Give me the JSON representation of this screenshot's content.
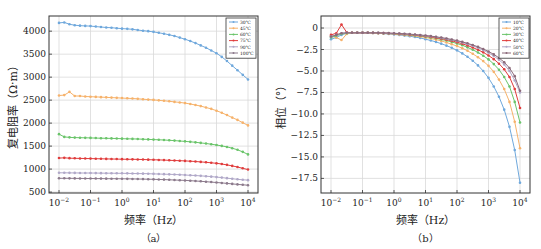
{
  "figure": {
    "panels": [
      {
        "id": "a",
        "caption": "（a）"
      },
      {
        "id": "b",
        "caption": "（b）"
      }
    ]
  },
  "chart_data": [
    {
      "type": "line",
      "panel": "(a)",
      "title": "",
      "xlabel": "频率（Hz）",
      "ylabel": "复电阻率（Ω·m）",
      "xscale": "log",
      "xlim": [
        0.01,
        10000
      ],
      "ylim": [
        480,
        4330
      ],
      "xticks": [
        "10⁻²",
        "10⁻¹",
        "10⁰",
        "10¹",
        "10²",
        "10³",
        "10⁴"
      ],
      "yticks": [
        500,
        1000,
        1500,
        2000,
        2500,
        3000,
        3500,
        4000
      ],
      "grid": true,
      "legend_position": "upper right",
      "x": [
        0.01,
        0.0147,
        0.0215,
        0.0316,
        0.0464,
        0.0681,
        0.1,
        0.147,
        0.215,
        0.316,
        0.464,
        0.681,
        1,
        1.47,
        2.15,
        3.16,
        4.64,
        6.81,
        10,
        14.7,
        21.5,
        31.6,
        46.4,
        68.1,
        100,
        147,
        215,
        316,
        464,
        681,
        1000,
        1470,
        2150,
        3160,
        4640,
        6810,
        10000
      ],
      "series": [
        {
          "name": "30℃",
          "color": "#6fa8dc",
          "values": [
            4180,
            4190,
            4150,
            4130,
            4120,
            4115,
            4110,
            4100,
            4090,
            4080,
            4075,
            4065,
            4055,
            4050,
            4040,
            4025,
            4010,
            4000,
            3985,
            3965,
            3945,
            3920,
            3895,
            3860,
            3825,
            3785,
            3740,
            3690,
            3640,
            3580,
            3520,
            3440,
            3350,
            3250,
            3150,
            3050,
            2950
          ]
        },
        {
          "name": "45℃",
          "color": "#f6b26b",
          "values": [
            2600,
            2610,
            2680,
            2590,
            2590,
            2580,
            2575,
            2570,
            2565,
            2560,
            2555,
            2550,
            2545,
            2540,
            2535,
            2528,
            2520,
            2512,
            2505,
            2495,
            2485,
            2475,
            2462,
            2450,
            2435,
            2415,
            2395,
            2370,
            2340,
            2310,
            2270,
            2225,
            2175,
            2120,
            2070,
            2010,
            1950
          ]
        },
        {
          "name": "60℃",
          "color": "#6ac46a",
          "values": [
            1760,
            1700,
            1690,
            1685,
            1682,
            1680,
            1678,
            1675,
            1672,
            1670,
            1668,
            1665,
            1662,
            1660,
            1657,
            1654,
            1650,
            1646,
            1642,
            1637,
            1632,
            1626,
            1620,
            1612,
            1603,
            1593,
            1582,
            1570,
            1557,
            1542,
            1525,
            1505,
            1482,
            1455,
            1420,
            1375,
            1320
          ]
        },
        {
          "name": "75℃",
          "color": "#e03c3c",
          "values": [
            1240,
            1245,
            1238,
            1235,
            1232,
            1230,
            1228,
            1226,
            1224,
            1222,
            1220,
            1218,
            1216,
            1214,
            1212,
            1210,
            1208,
            1205,
            1202,
            1199,
            1196,
            1192,
            1188,
            1183,
            1178,
            1172,
            1165,
            1157,
            1148,
            1137,
            1125,
            1110,
            1092,
            1070,
            1045,
            1018,
            990
          ]
        },
        {
          "name": "90℃",
          "color": "#b0a8c8",
          "values": [
            920,
            920,
            918,
            917,
            916,
            915,
            914,
            913,
            912,
            911,
            910,
            909,
            908,
            907,
            905,
            903,
            901,
            899,
            896,
            893,
            890,
            886,
            882,
            877,
            872,
            866,
            860,
            853,
            845,
            836,
            826,
            815,
            803,
            790,
            778,
            768,
            760
          ]
        },
        {
          "name": "100℃",
          "color": "#8c7a8c",
          "values": [
            800,
            800,
            799,
            798,
            797,
            796,
            795,
            794,
            793,
            792,
            791,
            790,
            789,
            788,
            786,
            784,
            782,
            780,
            777,
            774,
            771,
            767,
            763,
            758,
            753,
            747,
            741,
            734,
            726,
            718,
            709,
            699,
            689,
            678,
            667,
            658,
            650
          ]
        }
      ]
    },
    {
      "type": "line",
      "panel": "(b)",
      "title": "",
      "xlabel": "频率（Hz）",
      "ylabel": "相位（°）",
      "xscale": "log",
      "xlim": [
        0.01,
        10000
      ],
      "ylim": [
        -19.2,
        1.4
      ],
      "xticks": [
        "10⁻²",
        "10⁻¹",
        "10⁰",
        "10¹",
        "10²",
        "10³",
        "10⁴"
      ],
      "yticks": [
        0,
        -2.5,
        -5.0,
        -7.5,
        -10.0,
        -12.5,
        -15.0,
        -17.5
      ],
      "ytick_labels": [
        "0",
        "−2.5",
        "−5.0",
        "−7.5",
        "−10.0",
        "−12.5",
        "−15.0",
        "−17.5"
      ],
      "grid": true,
      "legend_position": "upper right",
      "x": [
        0.01,
        0.0147,
        0.0215,
        0.0316,
        0.0464,
        0.0681,
        0.1,
        0.147,
        0.215,
        0.316,
        0.464,
        0.681,
        1,
        1.47,
        2.15,
        3.16,
        4.64,
        6.81,
        10,
        14.7,
        21.5,
        31.6,
        46.4,
        68.1,
        100,
        147,
        215,
        316,
        464,
        681,
        1000,
        1470,
        2150,
        3160,
        4640,
        6810,
        10000
      ],
      "series": [
        {
          "name": "10℃",
          "color": "#6fa8dc",
          "values": [
            -1.3,
            -1.1,
            -0.8,
            -0.6,
            -0.55,
            -0.55,
            -0.55,
            -0.55,
            -0.58,
            -0.6,
            -0.65,
            -0.7,
            -0.75,
            -0.8,
            -0.88,
            -0.95,
            -1.05,
            -1.15,
            -1.3,
            -1.45,
            -1.62,
            -1.82,
            -2.05,
            -2.3,
            -2.6,
            -2.95,
            -3.35,
            -3.8,
            -4.35,
            -5.0,
            -5.8,
            -6.8,
            -8.0,
            -9.5,
            -11.5,
            -14.2,
            -18.0
          ]
        },
        {
          "name": "20℃",
          "color": "#f6b26b",
          "values": [
            -0.9,
            -1.1,
            -1.4,
            -0.7,
            -0.55,
            -0.55,
            -0.55,
            -0.55,
            -0.57,
            -0.6,
            -0.63,
            -0.67,
            -0.7,
            -0.75,
            -0.8,
            -0.86,
            -0.93,
            -1.0,
            -1.1,
            -1.22,
            -1.35,
            -1.5,
            -1.68,
            -1.88,
            -2.1,
            -2.35,
            -2.65,
            -3.0,
            -3.4,
            -3.85,
            -4.4,
            -5.1,
            -6.0,
            -7.1,
            -8.6,
            -10.9,
            -14.0
          ]
        },
        {
          "name": "30℃",
          "color": "#6ac46a",
          "values": [
            -1.1,
            -0.9,
            -0.7,
            -0.6,
            -0.55,
            -0.55,
            -0.55,
            -0.55,
            -0.56,
            -0.58,
            -0.6,
            -0.63,
            -0.66,
            -0.7,
            -0.75,
            -0.8,
            -0.86,
            -0.93,
            -1.0,
            -1.1,
            -1.2,
            -1.32,
            -1.46,
            -1.62,
            -1.8,
            -2.0,
            -2.25,
            -2.52,
            -2.85,
            -3.22,
            -3.65,
            -4.2,
            -4.85,
            -5.7,
            -6.8,
            -8.6,
            -11.0
          ]
        },
        {
          "name": "40℃",
          "color": "#e03c3c",
          "values": [
            -0.8,
            -0.6,
            0.4,
            -0.5,
            -0.55,
            -0.55,
            -0.55,
            -0.55,
            -0.56,
            -0.57,
            -0.59,
            -0.61,
            -0.64,
            -0.68,
            -0.72,
            -0.77,
            -0.82,
            -0.88,
            -0.95,
            -1.03,
            -1.12,
            -1.23,
            -1.35,
            -1.49,
            -1.65,
            -1.83,
            -2.03,
            -2.27,
            -2.53,
            -2.83,
            -3.2,
            -3.62,
            -4.15,
            -4.8,
            -5.7,
            -7.1,
            -9.3
          ]
        },
        {
          "name": "50℃",
          "color": "#b0a8c8",
          "values": [
            -1.0,
            -0.8,
            -0.6,
            -0.55,
            -0.55,
            -0.55,
            -0.55,
            -0.55,
            -0.55,
            -0.56,
            -0.58,
            -0.6,
            -0.62,
            -0.65,
            -0.69,
            -0.73,
            -0.78,
            -0.84,
            -0.9,
            -0.97,
            -1.05,
            -1.15,
            -1.26,
            -1.38,
            -1.52,
            -1.68,
            -1.86,
            -2.07,
            -2.3,
            -2.57,
            -2.88,
            -3.25,
            -3.7,
            -4.25,
            -5.0,
            -6.1,
            -7.5
          ]
        },
        {
          "name": "60℃",
          "color": "#8c6a7a",
          "values": [
            -1.0,
            -0.8,
            -0.6,
            -0.55,
            -0.55,
            -0.55,
            -0.55,
            -0.55,
            -0.55,
            -0.56,
            -0.57,
            -0.59,
            -0.61,
            -0.64,
            -0.67,
            -0.71,
            -0.76,
            -0.81,
            -0.87,
            -0.94,
            -1.02,
            -1.11,
            -1.21,
            -1.33,
            -1.46,
            -1.61,
            -1.78,
            -1.97,
            -2.19,
            -2.44,
            -2.73,
            -3.07,
            -3.48,
            -3.98,
            -4.65,
            -5.6,
            -7.3
          ]
        }
      ]
    }
  ]
}
